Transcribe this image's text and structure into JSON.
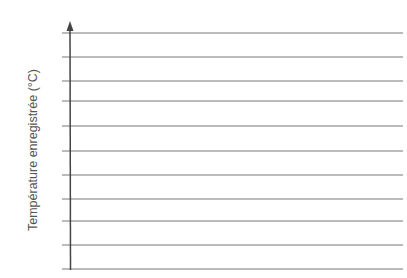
{
  "chart_data": {
    "type": "line",
    "title": "",
    "xlabel": "",
    "ylabel": "Température enregistrée (°C)",
    "series": [],
    "grid": true,
    "gridlines_y_px": [
      33,
      57,
      81,
      101,
      126,
      151,
      175,
      199,
      221,
      245,
      269
    ],
    "legend": null
  },
  "colors": {
    "axis": "#444444",
    "grid": "#777777",
    "label": "#555555"
  }
}
